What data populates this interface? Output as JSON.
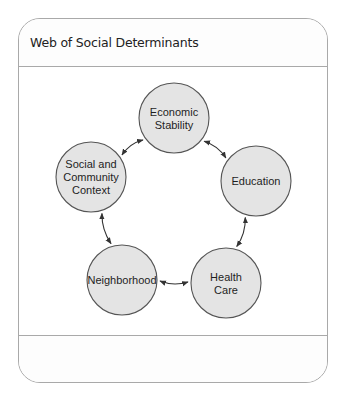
{
  "panel": {
    "title": "Web of Social Determinants"
  },
  "diagram": {
    "colors": {
      "node_fill": "#e4e4e4",
      "node_stroke": "#555555",
      "arrow": "#333333",
      "frame": "#a9a9a9"
    },
    "nodes": [
      {
        "id": "economic-stability",
        "lines": [
          "Economic",
          "Stability"
        ]
      },
      {
        "id": "education",
        "lines": [
          "Education"
        ]
      },
      {
        "id": "health-care",
        "lines": [
          "Health",
          "Care"
        ]
      },
      {
        "id": "neighborhood",
        "lines": [
          "Neighborhood"
        ]
      },
      {
        "id": "social-and-community-context",
        "lines": [
          "Social and",
          "Community",
          "Context"
        ]
      }
    ],
    "edges": [
      {
        "from": "economic-stability",
        "to": "education",
        "bidirectional": true
      },
      {
        "from": "education",
        "to": "health-care",
        "bidirectional": true
      },
      {
        "from": "health-care",
        "to": "neighborhood",
        "bidirectional": true
      },
      {
        "from": "neighborhood",
        "to": "social-and-community-context",
        "bidirectional": true
      },
      {
        "from": "social-and-community-context",
        "to": "economic-stability",
        "bidirectional": true
      }
    ]
  }
}
